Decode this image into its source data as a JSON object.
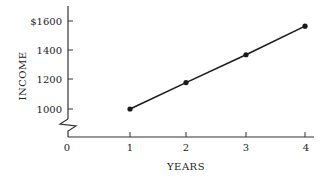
{
  "chart_data": {
    "type": "line",
    "title": "",
    "xlabel": "YEARS",
    "ylabel": "INCOME",
    "x": [
      1,
      2,
      3,
      4
    ],
    "series": [
      {
        "name": "Income",
        "values": [
          1000,
          1180,
          1370,
          1565
        ]
      }
    ],
    "x_ticks": [
      "0",
      "1",
      "2",
      "3",
      "4"
    ],
    "y_ticks": [
      "$1600",
      "1400",
      "1200",
      "1000"
    ],
    "y_tick_values": [
      1600,
      1400,
      1200,
      1000
    ],
    "ylim": [
      1000,
      1600
    ],
    "xlim": [
      0,
      4
    ],
    "y_axis_break": true,
    "grid": false,
    "legend": "none",
    "markers": "filled-circle",
    "colors": {
      "line": "#1a1a1a",
      "axis": "#333333"
    }
  }
}
